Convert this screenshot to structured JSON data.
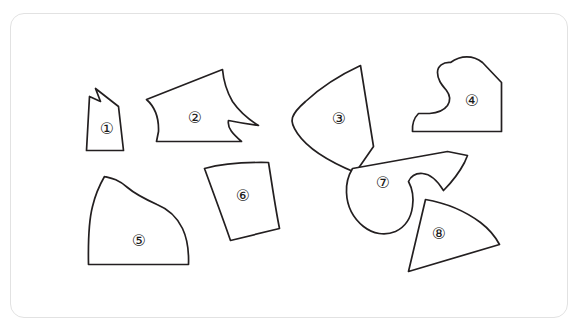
{
  "figure": {
    "title": "",
    "background_color": "#ffffff",
    "card": {
      "border_color": "#e2e2e2",
      "fill_color": "#ffffff",
      "corner_radius": 14
    },
    "stroke_color": "#231f20",
    "shape_fill_color": "#ffffff"
  },
  "pieces": [
    {
      "id": 1,
      "label": "①",
      "label_x": 107,
      "label_y": 128,
      "description": "narrow tall quadrilateral with notch at top left",
      "path": "M 95.5 88.5 L 100.5 101.5 L 89.5 96.5 L 86.5 150.5 L 123.5 150.5 L 118.5 106.5 Z"
    },
    {
      "id": 2,
      "label": "②",
      "label_x": 195,
      "label_y": 117,
      "description": "large polygon with pointed left vertex and spiked concave right edge",
      "path": "M 146.5 99.5 C 155 107 159 118 158.5 131.5 L 156.5 141.5 L 241.5 141.5 C 233 134 227 128 228.5 120.5 C 236 122 247 124 258.5 125.5 C 248 119 239 111 232.5 101.5 C 227 92 223.5 81 222.5 69.5 Z"
    },
    {
      "id": 3,
      "label": "③",
      "label_x": 339,
      "label_y": 118,
      "description": "rounded fan wedge with apex at upper right",
      "path": "M 360.5 65.5 C 340 75 320 88 305.5 101.5 C 298 108 294 113 292.5 117.5 C 291 122 293 127 297.5 133.5 C 306 146 325 160 355.5 172.5 L 373.5 146.5 Z"
    },
    {
      "id": 4,
      "label": "④",
      "label_x": 472,
      "label_y": 100,
      "description": "boot shaped piece with S curve interior on the left",
      "path": "M 450.5 62.5 C 443 62 437.5 66 437.5 72.5 C 437.5 80 442 85 446.5 90.5 C 450 95 451 100 447.5 105.5 C 443.5 111 437 113 429.5 113.5 L 418.5 113.5 C 414 118 412 124 412.5 131.5 L 501.5 131.5 L 501.5 82.5 L 482.5 62.5 C 473 55 461 55 450.5 62.5 Z"
    },
    {
      "id": 5,
      "label": "⑤",
      "label_x": 139,
      "label_y": 240,
      "description": "dome with a long S curve sloping to the right side",
      "path": "M 104.5 176.5 C 99 186 95 196 92.5 206.5 C 89 220 88 238 88.5 264.5 L 188.5 264.5 C 189 250 187 238 182.5 228.5 C 177 217 168 209 157 204.5 C 145 199 135 194 127.5 187.5 C 118 179 111 178 104.5 176.5 Z"
    },
    {
      "id": 6,
      "label": "⑥",
      "label_x": 243,
      "label_y": 195,
      "description": "fan trapezoid wider at top with slightly curved edges",
      "path": "M 204.5 168.5 C 221 164 241 162 268.5 162.5 C 272 184 275 206 279.5 228.5 L 230.5 240.5 C 222 216 213 192 204.5 168.5 Z"
    },
    {
      "id": 7,
      "label": "⑦",
      "label_x": 383,
      "label_y": 182,
      "description": "curved hook piece with deep notch on the right and arm to upper right",
      "path": "M 447.5 151.5 L 352.5 168.5 C 348 176 346 184 346.5 192.5 C 347 206 353 218 363.5 226.5 C 373 234 385 236 395.5 231.5 C 405 227 411 218 412.5 206.5 C 414 196 412 188 408.5 181.5 C 411 176 416 173 422.5 173.5 C 430 174 437 180 443.5 190.5 C 452 182 459 173 464.5 162.5 L 467.5 155.5 Z"
    },
    {
      "id": 8,
      "label": "⑧",
      "label_x": 439,
      "label_y": 233,
      "description": "curved triangular wedge with convex upper right edge",
      "path": "M 425.5 199.5 C 446 203 465 211 480.5 222.5 C 489 229 495 236 499.5 244.5 L 408.5 271.5 Z"
    }
  ]
}
